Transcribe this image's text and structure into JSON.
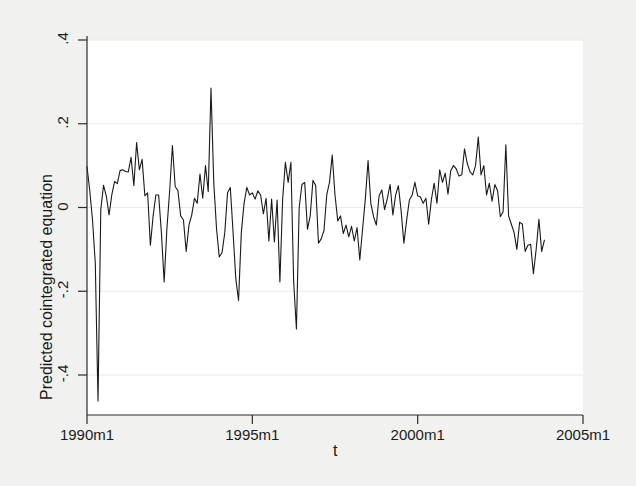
{
  "figure": {
    "background_color": "#f1f1ef",
    "plot_background_color": "#ffffff",
    "line_color": "#1a1a1a",
    "axis_color": "#2b2b2b",
    "grid_color": "#eceaea"
  },
  "chart_data": {
    "type": "line",
    "title": "",
    "subtitle": "",
    "xlabel": "t",
    "ylabel": "Predicted cointegrated equation",
    "grid": true,
    "legend": null,
    "legend_position": "none",
    "xlim": [
      1990.0,
      2005.0
    ],
    "ylim": [
      -0.47,
      0.42
    ],
    "xtick_labels": [
      "1990m1",
      "1995m1",
      "2000m1",
      "2005m1"
    ],
    "xtick_values": [
      1990.0,
      1995.0,
      2000.0,
      2005.0
    ],
    "ytick_labels": [
      ".4",
      ".2",
      "0",
      "-.2",
      "-.4"
    ],
    "ytick_values": [
      0.4,
      0.2,
      0,
      -0.2,
      -0.4
    ],
    "x_units": "monthly (m1 = January)",
    "series": [
      {
        "name": "Predicted cointegrated equation",
        "x_start": "1990m1",
        "x_end": "2003m10",
        "n_points": 166,
        "values": [
          0.098,
          0.04,
          -0.03,
          -0.132,
          -0.462,
          -0.005,
          0.053,
          0.028,
          -0.018,
          0.03,
          0.062,
          0.057,
          0.088,
          0.09,
          0.086,
          0.085,
          0.12,
          0.052,
          0.155,
          0.09,
          0.115,
          0.028,
          0.035,
          -0.09,
          -0.02,
          0.03,
          0.03,
          -0.06,
          -0.178,
          -0.05,
          0.04,
          0.148,
          0.05,
          0.04,
          -0.02,
          -0.03,
          -0.105,
          -0.042,
          -0.018,
          0.022,
          0.01,
          0.08,
          0.022,
          0.1,
          0.038,
          0.285,
          0.06,
          -0.05,
          -0.118,
          -0.108,
          -0.06,
          0.035,
          0.048,
          -0.058,
          -0.17,
          -0.222,
          -0.06,
          0.01,
          0.048,
          0.03,
          0.035,
          0.02,
          0.04,
          0.03,
          -0.015,
          0.022,
          -0.08,
          0.02,
          -0.082,
          0.018,
          -0.178,
          0.02,
          0.108,
          0.06,
          0.108,
          -0.178,
          -0.29,
          0.0,
          0.055,
          0.06,
          -0.052,
          -0.02,
          0.065,
          0.052,
          -0.085,
          -0.075,
          -0.055,
          0.03,
          0.06,
          0.125,
          0.03,
          -0.032,
          -0.02,
          -0.062,
          -0.042,
          -0.07,
          -0.045,
          -0.08,
          -0.048,
          -0.125,
          -0.052,
          0.02,
          0.112,
          0.01,
          -0.022,
          -0.042,
          0.028,
          0.042,
          -0.005,
          0.022,
          0.055,
          -0.018,
          0.03,
          0.052,
          -0.008,
          -0.085,
          -0.03,
          0.018,
          0.03,
          0.06,
          0.028,
          0.025,
          0.01,
          0.022,
          -0.04,
          0.02,
          0.058,
          0.01,
          0.09,
          0.06,
          0.082,
          0.032,
          0.088,
          0.1,
          0.092,
          0.075,
          0.078,
          0.14,
          0.105,
          0.085,
          0.078,
          0.1,
          0.168,
          0.078,
          0.1,
          0.03,
          0.058,
          0.015,
          0.055,
          0.04,
          -0.022,
          -0.01,
          0.15,
          -0.02,
          -0.04,
          -0.06,
          -0.1,
          -0.035,
          -0.04,
          -0.105,
          -0.09,
          -0.088,
          -0.158,
          -0.1,
          -0.028,
          -0.105,
          -0.078
        ]
      }
    ]
  }
}
